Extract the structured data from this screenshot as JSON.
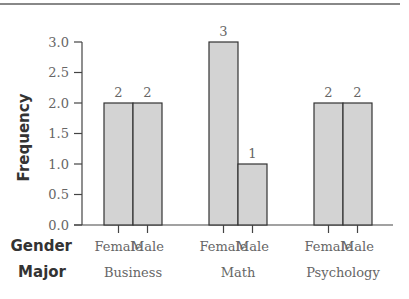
{
  "chart_data": {
    "type": "bar",
    "title": "",
    "xlabel": "",
    "ylabel": "Frequency",
    "ylim": [
      0,
      3.0
    ],
    "yticks": [
      "0.0",
      "0.5",
      "1.0",
      "1.5",
      "2.0",
      "2.5",
      "3.0"
    ],
    "grid": false,
    "legend": null,
    "x_row_titles": {
      "gender": "Gender",
      "major": "Major"
    },
    "groups": [
      {
        "major": "Business",
        "bars": [
          {
            "gender": "Female",
            "value": 2
          },
          {
            "gender": "Male",
            "value": 2
          }
        ]
      },
      {
        "major": "Math",
        "bars": [
          {
            "gender": "Female",
            "value": 3
          },
          {
            "gender": "Male",
            "value": 1
          }
        ]
      },
      {
        "major": "Psychology",
        "bars": [
          {
            "gender": "Female",
            "value": 2
          },
          {
            "gender": "Male",
            "value": 2
          }
        ]
      }
    ],
    "categories": [
      "Business Female",
      "Business Male",
      "Math Female",
      "Math Male",
      "Psychology Female",
      "Psychology Male"
    ],
    "values": [
      2,
      2,
      3,
      1,
      2,
      2
    ],
    "bar_color": "#d3d3d3",
    "edge_color": "#333333"
  }
}
